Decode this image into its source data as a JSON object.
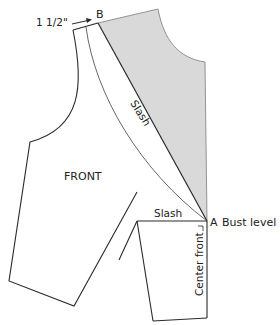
{
  "diagram": {
    "labels": {
      "measurement": "1 1/2\"",
      "point_b": "B",
      "point_a": "A",
      "bust_level": "Bust level",
      "front": "FRONT",
      "slash_diagonal": "Slash",
      "slash_horizontal": "Slash",
      "center_front": "Center front"
    },
    "colors": {
      "outline": "#2a2a2a",
      "shaded_region": "#d9d9d9",
      "background": "#ffffff"
    }
  }
}
